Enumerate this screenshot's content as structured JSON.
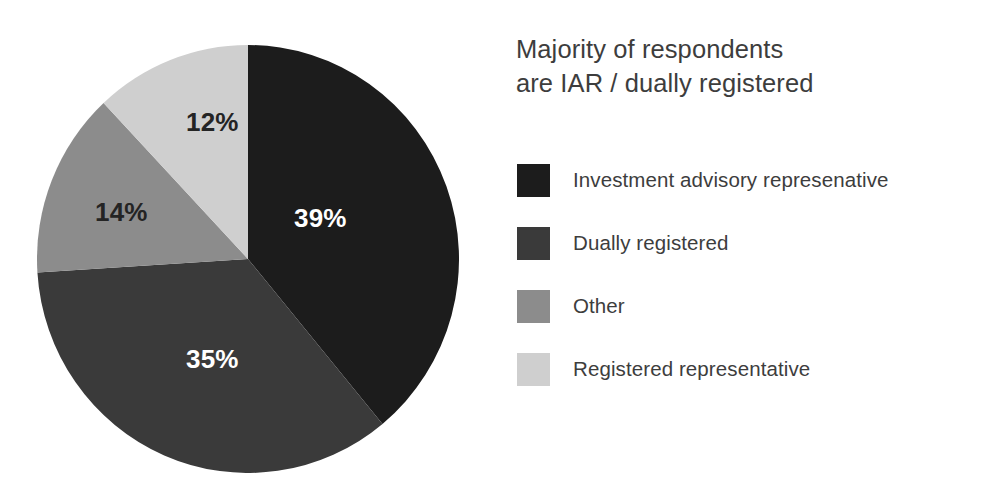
{
  "chart_data": {
    "type": "pie",
    "title": "Majority of respondents are IAR / dually registered",
    "title_lines": [
      "Majority of respondents",
      "are IAR / dually registered"
    ],
    "categories": [
      "Investment advisory represenative",
      "Dually registered",
      "Other",
      "Registered representative"
    ],
    "values": [
      39,
      35,
      14,
      12
    ],
    "value_labels": [
      "39%",
      "35%",
      "14%",
      "12%"
    ],
    "colors": [
      "#1c1c1c",
      "#3a3a3a",
      "#8c8c8c",
      "#cfcfcf"
    ],
    "label_text_colors": [
      "#ffffff",
      "#ffffff",
      "#242424",
      "#242424"
    ],
    "units": "percent",
    "total": 100,
    "start_angle_deg": 0,
    "direction": "clockwise",
    "legend_position": "right",
    "grid": false,
    "xlabel": "",
    "ylabel": ""
  },
  "legend": {
    "items": [
      {
        "label": "Investment advisory represenative",
        "color": "#1c1c1c"
      },
      {
        "label": "Dually registered",
        "color": "#3a3a3a"
      },
      {
        "label": "Other",
        "color": "#8c8c8c"
      },
      {
        "label": "Registered representative",
        "color": "#cfcfcf"
      }
    ]
  }
}
